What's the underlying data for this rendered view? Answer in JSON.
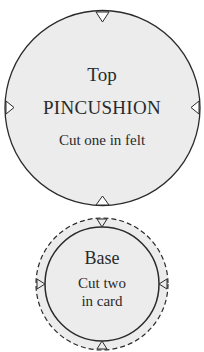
{
  "top_piece": {
    "title": "Top",
    "name": "PINCUSHION",
    "instruction": "Cut one in felt"
  },
  "base_piece": {
    "title": "Base",
    "instruction_line1": "Cut two",
    "instruction_line2": "in card"
  },
  "colors": {
    "fill": "#ececec",
    "stroke": "#2a2a2a"
  }
}
